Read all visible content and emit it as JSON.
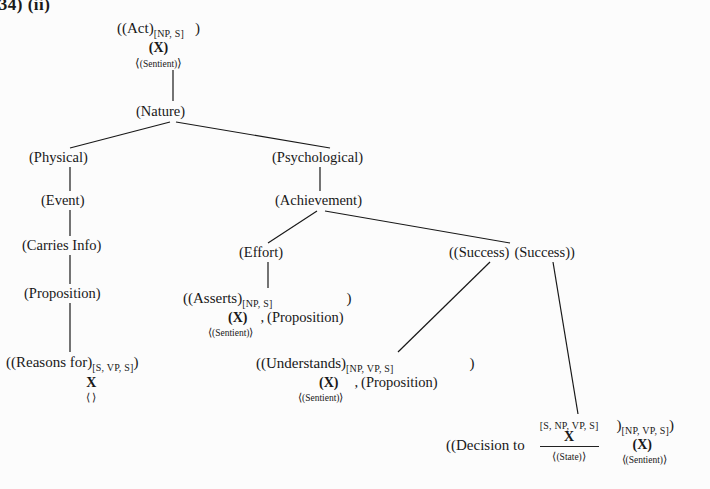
{
  "page": {
    "caption_fragment": ".34)  (ii)",
    "background_color": "#fcfcfc",
    "ink_color": "#181818"
  },
  "tree": {
    "root": {
      "id": "act",
      "line1_label": "((Act)",
      "line1_subscript": "[NP, S]",
      "line1_tail": ")",
      "line2": "(X)",
      "line3_open": "⟨",
      "line3_body": "(Sentient)",
      "line3_close": "⟩"
    },
    "nature": {
      "id": "nature",
      "label": "(Nature)"
    },
    "physical": {
      "id": "physical",
      "label": "(Physical)"
    },
    "event": {
      "id": "event",
      "label": "(Event)"
    },
    "carries_info": {
      "id": "carries-info",
      "label": "(Carries Info)"
    },
    "proposition": {
      "id": "proposition",
      "label": "(Proposition)"
    },
    "reasons_for": {
      "id": "reasons-for",
      "line1_label": "((Reasons for)",
      "line1_subscript": "[S, VP, S]",
      "line1_tail": ")",
      "line2": "X",
      "line3_open": "⟨",
      "line3_body": " ",
      "line3_close": "⟩"
    },
    "psychological": {
      "id": "psychological",
      "label": "(Psychological)"
    },
    "achievement": {
      "id": "achievement",
      "label": "(Achievement)"
    },
    "effort": {
      "id": "effort",
      "label": "(Effort)"
    },
    "asserts": {
      "id": "asserts",
      "line1_label": "((Asserts)",
      "line1_subscript": "[NP, S]",
      "line1_tail": ")",
      "line2": "(X)",
      "line3_open": "⟨",
      "line3_body": "(Sentient)",
      "line3_close": "⟩",
      "arg_separator": ",",
      "arg": "(Proposition)"
    },
    "success_pair": {
      "id": "success-pair",
      "left": "((Success)",
      "right": "(Success))"
    },
    "understands": {
      "id": "understands",
      "line1_label": "((Understands)",
      "line1_subscript": "[NP, VP, S]",
      "line1_tail": ")",
      "line2": "(X)",
      "line3_open": "⟨",
      "line3_body": "(Sentient)",
      "line3_close": "⟩",
      "arg_separator": ",",
      "arg": "(Proposition)"
    },
    "decision_to": {
      "id": "decision-to",
      "prefix": "((Decision to",
      "frac_superscript": "[S, NP, VP, S]",
      "frac_numerator": "X",
      "frac_denominator_open": "⟨",
      "frac_denominator_body": "(State)",
      "frac_denominator_close": "⟩",
      "close_paren": ")",
      "close_subscript": "[NP, VP, S]",
      "close_tail": ")",
      "line2": "(X)",
      "line3_open": "⟨",
      "line3_body": "(Sentient)",
      "line3_close": "⟩"
    }
  },
  "edges": [
    {
      "name": "act-to-nature",
      "x1": 173,
      "y1": 70,
      "x2": 173,
      "y2": 101
    },
    {
      "name": "nature-to-physical",
      "x1": 170,
      "y1": 122,
      "x2": 70,
      "y2": 148
    },
    {
      "name": "nature-to-psychological",
      "x1": 176,
      "y1": 122,
      "x2": 330,
      "y2": 148
    },
    {
      "name": "physical-to-event",
      "x1": 70,
      "y1": 167,
      "x2": 70,
      "y2": 191
    },
    {
      "name": "event-to-carries-info",
      "x1": 70,
      "y1": 210,
      "x2": 70,
      "y2": 236
    },
    {
      "name": "carries-info-to-proposition",
      "x1": 70,
      "y1": 255,
      "x2": 70,
      "y2": 284
    },
    {
      "name": "proposition-to-reasons-for",
      "x1": 70,
      "y1": 303,
      "x2": 70,
      "y2": 352
    },
    {
      "name": "psychological-to-achievement",
      "x1": 320,
      "y1": 167,
      "x2": 320,
      "y2": 191
    },
    {
      "name": "achievement-to-effort",
      "x1": 317,
      "y1": 211,
      "x2": 268,
      "y2": 243
    },
    {
      "name": "achievement-to-success",
      "x1": 325,
      "y1": 211,
      "x2": 510,
      "y2": 243
    },
    {
      "name": "effort-to-asserts",
      "x1": 268,
      "y1": 262,
      "x2": 268,
      "y2": 288
    },
    {
      "name": "success1-to-understands",
      "x1": 490,
      "y1": 262,
      "x2": 398,
      "y2": 352
    },
    {
      "name": "success2-to-decision",
      "x1": 553,
      "y1": 262,
      "x2": 578,
      "y2": 414
    }
  ]
}
